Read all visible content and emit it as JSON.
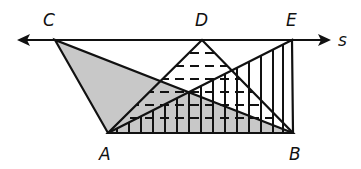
{
  "diagram": {
    "type": "geometry",
    "line": {
      "name": "s",
      "label": "s"
    },
    "points": [
      {
        "name": "C",
        "label": "C",
        "x": 55,
        "y": 40
      },
      {
        "name": "D",
        "label": "D",
        "x": 202,
        "y": 40
      },
      {
        "name": "E",
        "label": "E",
        "x": 292,
        "y": 40
      },
      {
        "name": "A",
        "label": "A",
        "x": 108,
        "y": 133
      },
      {
        "name": "B",
        "label": "B",
        "x": 293,
        "y": 133
      }
    ],
    "triangles": [
      {
        "name": "ABC",
        "fill": "gray shaded",
        "color": "#c8c8c8"
      },
      {
        "name": "ABD",
        "fill": "horizontal dashes"
      },
      {
        "name": "ABE",
        "fill": "vertical lines"
      }
    ]
  }
}
